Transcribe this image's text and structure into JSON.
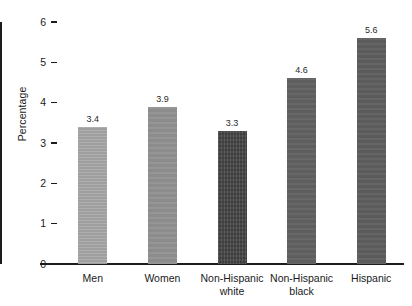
{
  "chart_data": {
    "type": "bar",
    "title": "",
    "subtitle": "",
    "xlabel": "",
    "ylabel": "Percentage",
    "categories": [
      "Men",
      "Women",
      "Non-Hispanic\nwhite",
      "Non-Hispanic\nblack",
      "Hispanic"
    ],
    "values": [
      3.4,
      3.9,
      3.3,
      4.6,
      5.6
    ],
    "value_labels": [
      "3.4",
      "3.9",
      "3.3",
      "4.6",
      "5.6"
    ],
    "ylim": [
      0,
      6
    ],
    "ytick_labels": [
      "0",
      "1",
      "2",
      "3",
      "4",
      "5",
      "6"
    ],
    "ytick_values": [
      0,
      1,
      2,
      3,
      4,
      5,
      6
    ],
    "grid": false,
    "legend": null,
    "legend_position": "none",
    "bar_colors": [
      "#a6a6a6",
      "#919191",
      "#474747",
      "#616161",
      "#5e5e5e"
    ],
    "bar_textures": [
      "tex-h",
      "tex-flat",
      "tex-v",
      "tex-flat",
      "tex-flat"
    ],
    "axis_color": "#1c1c1c",
    "background_color": "#ffffff",
    "text_color": "#1a1a1a"
  }
}
